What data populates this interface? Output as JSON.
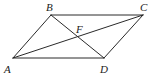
{
  "diagram": {
    "type": "geometry",
    "shape": "parallelogram with diagonal and connecting segment",
    "colors": {
      "stroke": "#2a2a2a",
      "label": "#222222",
      "background": "#ffffff"
    },
    "points": {
      "A": {
        "label": "A",
        "x": 13,
        "y": 58,
        "lx": 4,
        "ly": 73
      },
      "B": {
        "label": "B",
        "x": 51,
        "y": 15,
        "lx": 46,
        "ly": 11
      },
      "C": {
        "label": "C",
        "x": 143,
        "y": 15,
        "lx": 140,
        "ly": 11
      },
      "D": {
        "label": "D",
        "x": 104,
        "y": 58,
        "lx": 100,
        "ly": 73
      },
      "F": {
        "label": "F",
        "x": 78,
        "y": 37,
        "lx": 76,
        "ly": 33
      }
    },
    "segments": [
      {
        "name": "AB",
        "from": "A",
        "to": "B"
      },
      {
        "name": "BC",
        "from": "B",
        "to": "C"
      },
      {
        "name": "CD",
        "from": "C",
        "to": "D"
      },
      {
        "name": "DA",
        "from": "D",
        "to": "A"
      },
      {
        "name": "AC",
        "from": "A",
        "to": "C"
      },
      {
        "name": "BD",
        "from": "B",
        "to": "D"
      }
    ]
  }
}
